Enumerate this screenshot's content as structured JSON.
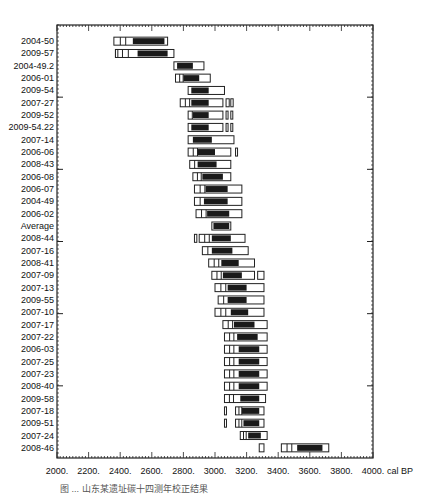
{
  "chart_data": {
    "type": "range-bars",
    "title": "",
    "xlabel": "cal BP",
    "ylabel": "",
    "xlim": [
      2000,
      4000
    ],
    "x_ticks": [
      "2000.",
      "2200.",
      "2400.",
      "2600.",
      "2800.",
      "3000.",
      "3200.",
      "3400.",
      "3600.",
      "3800.",
      "4000."
    ],
    "x_tick_values": [
      2000,
      2200,
      2400,
      2600,
      2800,
      3000,
      3200,
      3400,
      3600,
      3800,
      4000
    ],
    "grid": false,
    "legend": null,
    "note": "Each row shows calibrated date ranges: open box = 95.4% range, filled = 68.2% range (approx.)",
    "categories": [
      "2004-50",
      "2009-57",
      "2004-49.2",
      "2006-01",
      "2009-54",
      "2007-27",
      "2009-52",
      "2009-54.22",
      "2007-14",
      "2006-06",
      "2008-43",
      "2006-08",
      "2006-07",
      "2004-49",
      "2006-02",
      "Average",
      "2008-44",
      "2007-16",
      "2008-41",
      "2007-09",
      "2007-13",
      "2009-55",
      "2007-10",
      "2007-17",
      "2007-22",
      "2006-03",
      "2007-25",
      "2007-23",
      "2008-40",
      "2009-58",
      "2007-18",
      "2009-51",
      "2007-24",
      "2008-46"
    ],
    "rows": [
      {
        "label": "2004-50",
        "outer": [
          2360,
          2700
        ],
        "inner": [
          2480,
          2680
        ]
      },
      {
        "label": "2009-57",
        "outer": [
          2370,
          2740
        ],
        "inner": [
          2510,
          2700
        ],
        "extra": [
          [
            2370,
            2385
          ]
        ]
      },
      {
        "label": "2004-49.2",
        "outer": [
          2740,
          2930
        ],
        "inner": [
          2760,
          2860
        ]
      },
      {
        "label": "2006-01",
        "outer": [
          2750,
          2970
        ],
        "inner": [
          2800,
          2900
        ]
      },
      {
        "label": "2009-54",
        "outer": [
          2830,
          3060
        ],
        "inner": [
          2850,
          2960
        ]
      },
      {
        "label": "2007-27",
        "outer": [
          2780,
          3050
        ],
        "inner": [
          2850,
          2960
        ],
        "extra": [
          [
            3070,
            3090
          ],
          [
            3100,
            3115
          ]
        ]
      },
      {
        "label": "2009-52",
        "outer": [
          2830,
          3050
        ],
        "inner": [
          2860,
          2960
        ],
        "extra": [
          [
            3070,
            3080
          ],
          [
            3100,
            3110
          ]
        ]
      },
      {
        "label": "2009-54.22",
        "outer": [
          2830,
          3050
        ],
        "inner": [
          2850,
          2960
        ],
        "extra": [
          [
            3070,
            3080
          ],
          [
            3100,
            3110
          ]
        ]
      },
      {
        "label": "2007-14",
        "outer": [
          2830,
          3120
        ],
        "inner": [
          2860,
          2980
        ]
      },
      {
        "label": "2006-06",
        "outer": [
          2830,
          3100
        ],
        "inner": [
          2890,
          3000
        ],
        "extra": [
          [
            3130,
            3140
          ]
        ]
      },
      {
        "label": "2008-43",
        "outer": [
          2840,
          3100
        ],
        "inner": [
          2890,
          3010
        ]
      },
      {
        "label": "2006-08",
        "outer": [
          2860,
          3100
        ],
        "inner": [
          2920,
          3050
        ]
      },
      {
        "label": "2006-07",
        "outer": [
          2870,
          3170
        ],
        "inner": [
          2940,
          3080
        ]
      },
      {
        "label": "2004-49",
        "outer": [
          2870,
          3170
        ],
        "inner": [
          2930,
          3080
        ]
      },
      {
        "label": "2006-02",
        "outer": [
          2880,
          3170
        ],
        "inner": [
          2950,
          3090
        ]
      },
      {
        "label": "Average",
        "outer": [
          2980,
          3100
        ],
        "inner": [
          2990,
          3090
        ]
      },
      {
        "label": "2008-44",
        "outer": [
          2900,
          3190
        ],
        "inner": [
          2980,
          3100
        ],
        "extra": [
          [
            2870,
            2885
          ]
        ]
      },
      {
        "label": "2007-16",
        "outer": [
          2920,
          3210
        ],
        "inner": [
          2980,
          3110
        ]
      },
      {
        "label": "2008-41",
        "outer": [
          2960,
          3250
        ],
        "inner": [
          3040,
          3150
        ]
      },
      {
        "label": "2007-09",
        "outer": [
          2980,
          3250
        ],
        "inner": [
          3050,
          3170
        ],
        "extra": [
          [
            3270,
            3310
          ]
        ]
      },
      {
        "label": "2007-13",
        "outer": [
          3000,
          3310
        ],
        "inner": [
          3080,
          3200
        ]
      },
      {
        "label": "2009-55",
        "outer": [
          3020,
          3310
        ],
        "inner": [
          3080,
          3200
        ]
      },
      {
        "label": "2007-10",
        "outer": [
          3000,
          3310
        ],
        "inner": [
          3100,
          3210
        ]
      },
      {
        "label": "2007-17",
        "outer": [
          3050,
          3330
        ],
        "inner": [
          3120,
          3250
        ]
      },
      {
        "label": "2007-22",
        "outer": [
          3060,
          3330
        ],
        "inner": [
          3140,
          3270
        ]
      },
      {
        "label": "2006-03",
        "outer": [
          3060,
          3330
        ],
        "inner": [
          3150,
          3280
        ]
      },
      {
        "label": "2007-25",
        "outer": [
          3060,
          3330
        ],
        "inner": [
          3150,
          3280
        ]
      },
      {
        "label": "2007-23",
        "outer": [
          3060,
          3330
        ],
        "inner": [
          3150,
          3280
        ]
      },
      {
        "label": "2008-40",
        "outer": [
          3060,
          3330
        ],
        "inner": [
          3150,
          3280
        ]
      },
      {
        "label": "2009-58",
        "outer": [
          3060,
          3320
        ],
        "inner": [
          3160,
          3280
        ]
      },
      {
        "label": "2007-18",
        "outer": [
          3130,
          3310
        ],
        "inner": [
          3170,
          3280
        ],
        "extra": [
          [
            3060,
            3070
          ]
        ]
      },
      {
        "label": "2009-51",
        "outer": [
          3130,
          3310
        ],
        "inner": [
          3180,
          3280
        ],
        "extra": [
          [
            3060,
            3070
          ]
        ]
      },
      {
        "label": "2007-24",
        "outer": [
          3160,
          3330
        ],
        "inner": [
          3210,
          3290
        ]
      },
      {
        "label": "2008-46",
        "outer": [
          3420,
          3720
        ],
        "inner": [
          3520,
          3680
        ],
        "extra": [
          [
            3280,
            3310
          ]
        ]
      }
    ]
  },
  "caption": "图 ... 山东某遗址碳十四测年校正结果"
}
